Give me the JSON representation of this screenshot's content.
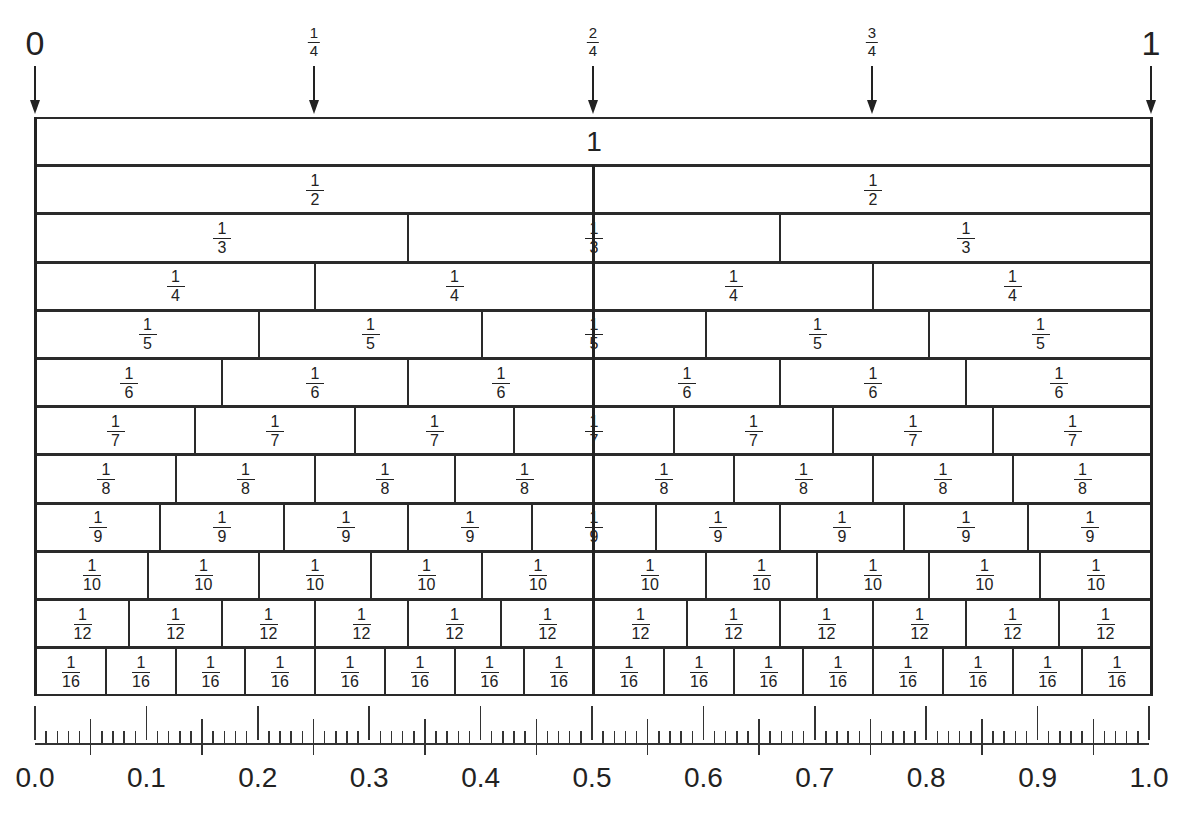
{
  "top_markers": [
    {
      "pos": 0,
      "label": "0",
      "type": "whole"
    },
    {
      "pos": 0.25,
      "num": "1",
      "den": "4",
      "type": "frac"
    },
    {
      "pos": 0.5,
      "num": "2",
      "den": "4",
      "type": "frac"
    },
    {
      "pos": 0.75,
      "num": "3",
      "den": "4",
      "type": "frac"
    },
    {
      "pos": 1,
      "label": "1",
      "type": "whole"
    }
  ],
  "strips": [
    {
      "denominator": 1,
      "label": "1"
    },
    {
      "denominator": 2,
      "num": "1",
      "den": "2"
    },
    {
      "denominator": 3,
      "num": "1",
      "den": "3"
    },
    {
      "denominator": 4,
      "num": "1",
      "den": "4"
    },
    {
      "denominator": 5,
      "num": "1",
      "den": "5"
    },
    {
      "denominator": 6,
      "num": "1",
      "den": "6"
    },
    {
      "denominator": 7,
      "num": "1",
      "den": "7"
    },
    {
      "denominator": 8,
      "num": "1",
      "den": "8"
    },
    {
      "denominator": 9,
      "num": "1",
      "den": "9"
    },
    {
      "denominator": 10,
      "num": "1",
      "den": "10"
    },
    {
      "denominator": 12,
      "num": "1",
      "den": "12"
    },
    {
      "denominator": 16,
      "num": "1",
      "den": "16"
    }
  ],
  "ruler": {
    "labels": [
      "0.0",
      "0.1",
      "0.2",
      "0.3",
      "0.4",
      "0.5",
      "0.6",
      "0.7",
      "0.8",
      "0.9",
      "1.0"
    ],
    "major_step": 0.1,
    "mid_step": 0.05,
    "minor_step": 0.01
  },
  "colors": {
    "line": "#2a2a2a",
    "background": "#ffffff",
    "text": "#222222"
  }
}
